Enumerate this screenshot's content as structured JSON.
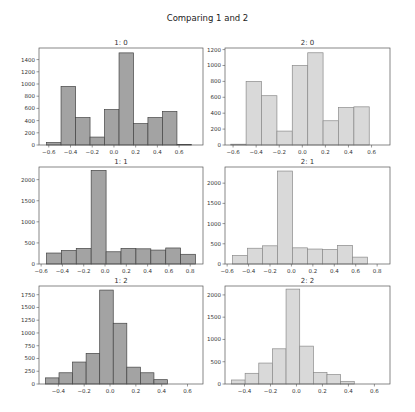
{
  "figure": {
    "title": "Comparing 1 and 2",
    "colors": {
      "series1_fill": "#a3a3a3",
      "series1_edge": "#444444",
      "series2_fill": "#d9d9d9",
      "series2_edge": "#8a8a8a",
      "axis": "#555555",
      "text": "#333333"
    }
  },
  "chart_data": [
    {
      "type": "bar",
      "title": "1: 0",
      "panel": [
        0,
        0
      ],
      "series": "1",
      "bin_edges": [
        -0.62,
        -0.487,
        -0.353,
        -0.22,
        -0.087,
        0.047,
        0.18,
        0.313,
        0.447,
        0.58,
        0.713
      ],
      "values": [
        40,
        960,
        450,
        130,
        580,
        1510,
        350,
        450,
        550,
        10
      ],
      "xlim": [
        -0.69,
        0.82
      ],
      "ylim": [
        0,
        1590
      ],
      "xticks": [
        -0.6,
        -0.4,
        -0.2,
        0.0,
        0.2,
        0.4,
        0.6
      ],
      "yticks": [
        0,
        200,
        400,
        600,
        800,
        1000,
        1200,
        1400
      ]
    },
    {
      "type": "bar",
      "title": "2: 0",
      "panel": [
        0,
        1
      ],
      "series": "2",
      "bin_edges": [
        -0.62,
        -0.487,
        -0.353,
        -0.22,
        -0.087,
        0.047,
        0.18,
        0.313,
        0.447,
        0.58
      ],
      "values": [
        10,
        800,
        620,
        175,
        1000,
        1160,
        305,
        470,
        480
      ],
      "xlim": [
        -0.67,
        0.76
      ],
      "ylim": [
        0,
        1220
      ],
      "xticks": [
        -0.6,
        -0.4,
        -0.2,
        0.0,
        0.2,
        0.4,
        0.6
      ],
      "yticks": [
        0,
        200,
        400,
        600,
        800,
        1000,
        1200
      ]
    },
    {
      "type": "bar",
      "title": "1: 1",
      "panel": [
        1,
        0
      ],
      "series": "1",
      "bin_edges": [
        -0.55,
        -0.41,
        -0.27,
        -0.13,
        0.01,
        0.15,
        0.29,
        0.43,
        0.57,
        0.71,
        0.85
      ],
      "values": [
        260,
        320,
        370,
        2220,
        290,
        370,
        360,
        330,
        380,
        230
      ],
      "xlim": [
        -0.62,
        0.92
      ],
      "ylim": [
        0,
        2300
      ],
      "xticks": [
        -0.6,
        -0.4,
        -0.2,
        0.0,
        0.2,
        0.4,
        0.6,
        0.8
      ],
      "yticks": [
        0,
        500,
        1000,
        1500,
        2000
      ]
    },
    {
      "type": "bar",
      "title": "2: 1",
      "panel": [
        1,
        1
      ],
      "series": "2",
      "bin_edges": [
        -0.55,
        -0.41,
        -0.27,
        -0.13,
        0.01,
        0.15,
        0.29,
        0.43,
        0.57,
        0.71,
        0.85
      ],
      "values": [
        210,
        390,
        450,
        2300,
        400,
        370,
        360,
        460,
        170,
        0
      ],
      "xlim": [
        -0.62,
        0.92
      ],
      "ylim": [
        0,
        2400
      ],
      "xticks": [
        -0.6,
        -0.4,
        -0.2,
        0.0,
        0.2,
        0.4,
        0.6,
        0.8
      ],
      "yticks": [
        0,
        500,
        1000,
        1500,
        2000
      ]
    },
    {
      "type": "bar",
      "title": "1: 2",
      "panel": [
        2,
        0
      ],
      "series": "1",
      "bin_edges": [
        -0.5,
        -0.395,
        -0.29,
        -0.185,
        -0.08,
        0.025,
        0.13,
        0.235,
        0.34,
        0.445,
        0.55
      ],
      "values": [
        120,
        220,
        430,
        600,
        1840,
        1190,
        330,
        220,
        85,
        0
      ],
      "xlim": [
        -0.55,
        0.72
      ],
      "ylim": [
        0,
        1920
      ],
      "xticks": [
        -0.4,
        -0.2,
        0.0,
        0.2,
        0.4,
        0.6
      ],
      "yticks": [
        0,
        250,
        500,
        750,
        1000,
        1250,
        1500,
        1750
      ]
    },
    {
      "type": "bar",
      "title": "2: 2",
      "panel": [
        2,
        1
      ],
      "series": "2",
      "bin_edges": [
        -0.5,
        -0.395,
        -0.29,
        -0.185,
        -0.08,
        0.025,
        0.13,
        0.235,
        0.34,
        0.445,
        0.55
      ],
      "values": [
        90,
        240,
        470,
        790,
        2130,
        850,
        260,
        210,
        60,
        0
      ],
      "xlim": [
        -0.55,
        0.72
      ],
      "ylim": [
        0,
        2200
      ],
      "xticks": [
        -0.4,
        -0.2,
        0.0,
        0.2,
        0.4,
        0.6
      ],
      "yticks": [
        0,
        500,
        1000,
        1500,
        2000
      ]
    }
  ]
}
